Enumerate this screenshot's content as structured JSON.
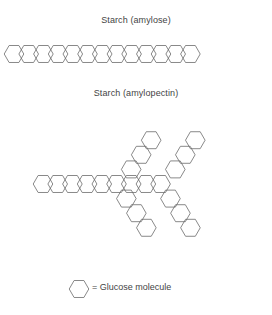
{
  "figure": {
    "amylose": {
      "caption": "Starch (amylose)",
      "unit_count": 13,
      "description": "unbranched straight chain of glucose hexagons"
    },
    "amylopectin": {
      "caption": "Starch (amylopectin)",
      "main_chain_count": 9,
      "branch_count": 4,
      "units_per_branch": 3,
      "description": "branched chain of glucose hexagons with four diagonal branches"
    },
    "legend": {
      "symbol": "hexagon-icon",
      "label": "= Glucose molecule"
    },
    "colors": {
      "stroke": "#6b6b6b",
      "text": "#444444",
      "background": "#ffffff"
    }
  }
}
